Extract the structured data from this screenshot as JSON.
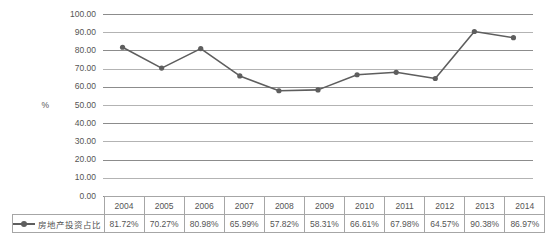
{
  "chart_data": {
    "type": "line",
    "title": "",
    "xlabel": "",
    "ylabel": "%",
    "ylim": [
      0,
      100
    ],
    "ytick_step": 10,
    "grid": true,
    "legend_position": "table-left",
    "categories": [
      "2004",
      "2005",
      "2006",
      "2007",
      "2008",
      "2009",
      "2010",
      "2011",
      "2012",
      "2013",
      "2014"
    ],
    "series": [
      {
        "name": "房地产投资占比",
        "values": [
          81.72,
          70.27,
          80.98,
          65.99,
          57.82,
          58.31,
          66.61,
          67.98,
          64.57,
          90.38,
          86.97
        ],
        "value_labels": [
          "81.72%",
          "70.27%",
          "80.98%",
          "65.99%",
          "57.82%",
          "58.31%",
          "66.61%",
          "67.98%",
          "64.57%",
          "90.38%",
          "86.97%"
        ],
        "color": "#5e5e5e",
        "marker": "circle"
      }
    ],
    "ytick_labels": [
      "100.00",
      "90.00",
      "80.00",
      "70.00",
      "60.00",
      "50.00",
      "40.00",
      "30.00",
      "20.00",
      "10.00",
      "0.00"
    ],
    "ytick_values": [
      100,
      90,
      80,
      70,
      60,
      50,
      40,
      30,
      20,
      10,
      0
    ]
  },
  "axis": {
    "y_title": "%"
  },
  "table": {
    "legend_label": "房地产投资占比",
    "year_header": [
      "2004",
      "2005",
      "2006",
      "2007",
      "2008",
      "2009",
      "2010",
      "2011",
      "2012",
      "2013",
      "2014"
    ],
    "value_row": [
      "81.72%",
      "70.27%",
      "80.98%",
      "65.99%",
      "57.82%",
      "58.31%",
      "66.61%",
      "67.98%",
      "64.57%",
      "90.38%",
      "86.97%"
    ]
  },
  "colors": {
    "series": "#5e5e5e",
    "gridline": "#b3b3b3",
    "gridline_major": "#8c8c8c",
    "table_border": "#a6a6a6",
    "text": "#555555",
    "background": "#ffffff"
  }
}
